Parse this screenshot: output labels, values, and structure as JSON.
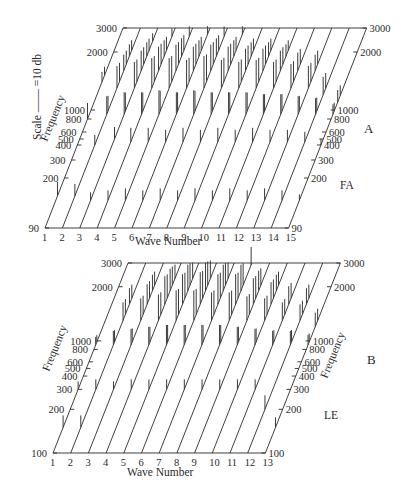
{
  "figure": {
    "scale_label": "Scale —— =10 db"
  },
  "chart_data": [
    {
      "type": "bar",
      "panel": "A",
      "subject": "FA",
      "title": "",
      "xlabel": "Wave Number",
      "ylabel": "Frequency",
      "x_ticks": [
        "1",
        "2",
        "3",
        "4",
        "5",
        "6",
        "7",
        "8",
        "9",
        "10",
        "11",
        "12",
        "13",
        "14",
        "15"
      ],
      "freq_ticks_left": [
        "90",
        "200",
        "300",
        "400",
        "500",
        "600",
        "800",
        "1000",
        "2000",
        "3000"
      ],
      "freq_ticks_right": [
        "90",
        "200",
        "300",
        "400",
        "500",
        "600",
        "800",
        "1000",
        "2000",
        "3000"
      ],
      "freq_range": [
        90,
        3000
      ],
      "projection": "oblique 3D waterfall (spectral lines per wave)",
      "series_description": "Each wave shows a line spectrum: a strong low-frequency component near the fundamental (~150-250 Hz) and a cluster of components in the 1000-2000 Hz range",
      "spectra": [
        {
          "wave": 1,
          "components": [
            [
              150,
              14
            ],
            [
              800,
              16
            ],
            [
              1400,
              10
            ]
          ]
        },
        {
          "wave": 2,
          "components": [
            [
              150,
              12
            ],
            [
              400,
              10
            ],
            [
              900,
              18
            ],
            [
              1300,
              22
            ],
            [
              1600,
              16
            ],
            [
              1900,
              12
            ]
          ]
        },
        {
          "wave": 3,
          "components": [
            [
              140,
              8
            ],
            [
              500,
              12
            ],
            [
              900,
              22
            ],
            [
              1300,
              26
            ],
            [
              1600,
              20
            ],
            [
              1900,
              14
            ],
            [
              2400,
              8
            ]
          ]
        },
        {
          "wave": 4,
          "components": [
            [
              140,
              10
            ],
            [
              450,
              14
            ],
            [
              900,
              22
            ],
            [
              1300,
              30
            ],
            [
              1600,
              24
            ],
            [
              1900,
              16
            ],
            [
              2600,
              8
            ]
          ]
        },
        {
          "wave": 5,
          "components": [
            [
              140,
              12
            ],
            [
              450,
              14
            ],
            [
              900,
              24
            ],
            [
              1300,
              30
            ],
            [
              1600,
              26
            ],
            [
              1900,
              18
            ],
            [
              2600,
              10
            ]
          ]
        },
        {
          "wave": 6,
          "components": [
            [
              140,
              10
            ],
            [
              450,
              12
            ],
            [
              900,
              22
            ],
            [
              1300,
              28
            ],
            [
              1600,
              24
            ],
            [
              1900,
              16
            ],
            [
              2700,
              8
            ]
          ]
        },
        {
          "wave": 7,
          "components": [
            [
              140,
              12
            ],
            [
              450,
              14
            ],
            [
              900,
              24
            ],
            [
              1300,
              32
            ],
            [
              1600,
              26
            ],
            [
              1900,
              18
            ],
            [
              2600,
              10
            ]
          ]
        },
        {
          "wave": 8,
          "components": [
            [
              140,
              10
            ],
            [
              450,
              12
            ],
            [
              900,
              22
            ],
            [
              1300,
              28
            ],
            [
              1600,
              24
            ],
            [
              1900,
              16
            ],
            [
              2700,
              8
            ]
          ]
        },
        {
          "wave": 9,
          "components": [
            [
              140,
              12
            ],
            [
              450,
              14
            ],
            [
              900,
              22
            ],
            [
              1300,
              26
            ],
            [
              1600,
              22
            ],
            [
              1900,
              14
            ]
          ]
        },
        {
          "wave": 10,
          "components": [
            [
              140,
              10
            ],
            [
              450,
              12
            ],
            [
              900,
              22
            ],
            [
              1300,
              28
            ],
            [
              1600,
              22
            ],
            [
              1900,
              14
            ]
          ]
        },
        {
          "wave": 11,
          "components": [
            [
              140,
              12
            ],
            [
              450,
              14
            ],
            [
              900,
              20
            ],
            [
              1300,
              26
            ],
            [
              1600,
              20
            ],
            [
              1900,
              12
            ]
          ]
        },
        {
          "wave": 12,
          "components": [
            [
              140,
              10
            ],
            [
              450,
              12
            ],
            [
              900,
              20
            ],
            [
              1300,
              24
            ],
            [
              1600,
              18
            ]
          ]
        },
        {
          "wave": 13,
          "components": [
            [
              140,
              12
            ],
            [
              450,
              12
            ],
            [
              900,
              18
            ],
            [
              1300,
              22
            ],
            [
              1600,
              16
            ]
          ]
        },
        {
          "wave": 14,
          "components": [
            [
              140,
              10
            ],
            [
              450,
              10
            ],
            [
              900,
              16
            ],
            [
              1200,
              18
            ]
          ]
        },
        {
          "wave": 15,
          "components": [
            [
              140,
              6
            ],
            [
              400,
              6
            ],
            [
              900,
              10
            ],
            [
              1100,
              12
            ]
          ]
        }
      ]
    },
    {
      "type": "bar",
      "panel": "B",
      "subject": "LE",
      "title": "",
      "xlabel": "Wave Number",
      "ylabel": "Frequency",
      "x_ticks": [
        "1",
        "2",
        "3",
        "4",
        "5",
        "6",
        "7",
        "8",
        "9",
        "10",
        "11",
        "12",
        "13"
      ],
      "freq_ticks_left": [
        "100",
        "200",
        "300",
        "400",
        "500",
        "600",
        "800",
        "1000",
        "2000",
        "3000"
      ],
      "freq_ticks_right": [
        "100",
        "200",
        "300",
        "400",
        "500",
        "600",
        "800",
        "1000",
        "2000",
        "3000"
      ],
      "freq_range": [
        100,
        3000
      ],
      "projection": "oblique 3D waterfall (spectral lines per wave)",
      "series_description": "Each wave shows a line spectrum with a low-frequency component near 150-300 Hz and dense clusters between 1000 and 2500 Hz",
      "spectra": [
        {
          "wave": 1,
          "components": [
            [
              150,
              12
            ],
            [
              300,
              8
            ],
            [
              900,
              8
            ]
          ]
        },
        {
          "wave": 2,
          "components": [
            [
              150,
              12
            ],
            [
              300,
              10
            ],
            [
              900,
              14
            ],
            [
              1300,
              18
            ],
            [
              1600,
              16
            ]
          ]
        },
        {
          "wave": 3,
          "components": [
            [
              300,
              8
            ],
            [
              900,
              16
            ],
            [
              1300,
              22
            ],
            [
              1600,
              20
            ],
            [
              1900,
              16
            ]
          ]
        },
        {
          "wave": 4,
          "components": [
            [
              300,
              10
            ],
            [
              900,
              18
            ],
            [
              1300,
              26
            ],
            [
              1600,
              28
            ],
            [
              1900,
              22
            ],
            [
              2300,
              14
            ]
          ]
        },
        {
          "wave": 5,
          "components": [
            [
              300,
              10
            ],
            [
              900,
              20
            ],
            [
              1300,
              30
            ],
            [
              1600,
              30
            ],
            [
              1900,
              26
            ],
            [
              2300,
              16
            ]
          ]
        },
        {
          "wave": 6,
          "components": [
            [
              300,
              10
            ],
            [
              900,
              20
            ],
            [
              1300,
              30
            ],
            [
              1600,
              32
            ],
            [
              1900,
              28
            ],
            [
              2300,
              18
            ]
          ]
        },
        {
          "wave": 7,
          "components": [
            [
              300,
              10
            ],
            [
              900,
              20
            ],
            [
              1300,
              28
            ],
            [
              1600,
              30
            ],
            [
              1900,
              26
            ],
            [
              2300,
              16
            ]
          ]
        },
        {
          "wave": 8,
          "components": [
            [
              300,
              10
            ],
            [
              900,
              20
            ],
            [
              1300,
              28
            ],
            [
              1600,
              30
            ],
            [
              1900,
              26
            ],
            [
              2900,
              18
            ]
          ]
        },
        {
          "wave": 9,
          "components": [
            [
              300,
              10
            ],
            [
              900,
              18
            ],
            [
              1300,
              24
            ],
            [
              1600,
              26
            ],
            [
              1900,
              20
            ]
          ]
        },
        {
          "wave": 10,
          "components": [
            [
              300,
              10
            ],
            [
              900,
              16
            ],
            [
              1300,
              22
            ],
            [
              1600,
              22
            ],
            [
              1900,
              16
            ]
          ]
        },
        {
          "wave": 11,
          "components": [
            [
              300,
              10
            ],
            [
              900,
              14
            ],
            [
              1300,
              18
            ],
            [
              1600,
              18
            ]
          ]
        },
        {
          "wave": 12,
          "components": [
            [
              200,
              14
            ],
            [
              900,
              14
            ],
            [
              1300,
              16
            ],
            [
              1600,
              16
            ]
          ]
        },
        {
          "wave": 13,
          "components": [
            [
              150,
              10
            ],
            [
              900,
              10
            ],
            [
              1200,
              14
            ]
          ]
        }
      ]
    }
  ],
  "panels": {
    "A": {
      "letter": "A",
      "subject": "FA",
      "xlabel": "Wave Number",
      "ylabel": "Frequency"
    },
    "B": {
      "letter": "B",
      "subject": "LE",
      "xlabel": "Wave Number",
      "ylabel": "Frequency"
    }
  }
}
